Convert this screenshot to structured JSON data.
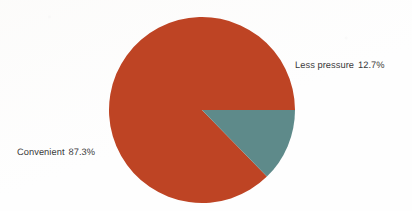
{
  "chart_data": {
    "type": "pie",
    "title": "",
    "subtitle": "",
    "xlabel": "",
    "ylabel": "",
    "grid": false,
    "legend_position": "none",
    "labels_inline": true,
    "start_angle_deg": 0,
    "direction": "counterclockwise",
    "categories": [
      "Convenient",
      "Less pressure"
    ],
    "values": [
      87.3,
      12.7
    ],
    "value_suffix": "%",
    "slices": [
      {
        "name": "Convenient",
        "value": 87.3,
        "value_text": "87.3%",
        "label_text": "Convenient  87.3%",
        "color": "#be4424",
        "angle_deg": 314.3,
        "label_side": "left"
      },
      {
        "name": "Less pressure",
        "value": 12.7,
        "value_text": "12.7%",
        "label_text": "Less pressure  12.7%",
        "color": "#5e8a8a",
        "angle_deg": 45.7,
        "label_side": "right"
      }
    ],
    "annotations": [],
    "geometry": {
      "center_x": 202,
      "center_y": 110,
      "radius": 93
    },
    "colors": {
      "background": "#ffffff",
      "text": "#3a3a3a",
      "convenient": "#be4424",
      "less_pressure": "#5e8a8a"
    }
  }
}
